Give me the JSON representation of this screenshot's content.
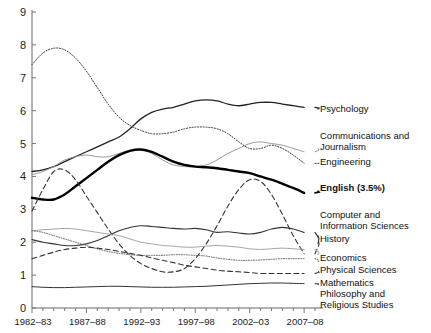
{
  "chart_data": {
    "type": "line",
    "title": "",
    "xlabel": "",
    "ylabel": "",
    "xlim": [
      1982,
      2008
    ],
    "ylim": [
      0,
      9
    ],
    "grid": false,
    "legend_position": "right-inline",
    "x_tick_labels": [
      "1982–83",
      "1987–88",
      "1992–93",
      "1997–98",
      "2002–03",
      "2007–08"
    ],
    "x_tick_values": [
      1982,
      1987,
      1992,
      1997,
      2002,
      2007
    ],
    "y_tick_labels": [
      "0",
      "1",
      "2",
      "3",
      "4",
      "5",
      "6",
      "7",
      "8",
      "9"
    ],
    "y_tick_values": [
      0,
      1,
      2,
      3,
      4,
      5,
      6,
      7,
      8,
      9
    ],
    "x": [
      1982,
      1983,
      1984,
      1985,
      1986,
      1987,
      1988,
      1989,
      1990,
      1991,
      1992,
      1993,
      1994,
      1995,
      1996,
      1997,
      1998,
      1999,
      2000,
      2001,
      2002,
      2003,
      2004,
      2005,
      2006,
      2007
    ],
    "series": [
      {
        "name": "Psychology",
        "label": "Psychology",
        "style": "solid",
        "width": 1.3,
        "color": "#222222",
        "label_y_value": 6.05,
        "values": [
          4.15,
          4.2,
          4.3,
          4.45,
          4.6,
          4.75,
          4.9,
          5.05,
          5.2,
          5.45,
          5.75,
          5.95,
          6.05,
          6.1,
          6.2,
          6.3,
          6.33,
          6.3,
          6.2,
          6.15,
          6.2,
          6.25,
          6.25,
          6.2,
          6.15,
          6.1
        ]
      },
      {
        "name": "Communications and Journalism",
        "label": "Communications and Journalism",
        "style": "solid",
        "width": 1.0,
        "color": "#9a9a9a",
        "label_y_value": 4.85,
        "values": [
          4.05,
          4.15,
          4.3,
          4.5,
          4.6,
          4.65,
          4.6,
          4.6,
          4.7,
          4.8,
          4.82,
          4.7,
          4.5,
          4.35,
          4.3,
          4.3,
          4.35,
          4.5,
          4.7,
          4.85,
          5.0,
          5.05,
          5.0,
          4.95,
          4.85,
          4.75
        ]
      },
      {
        "name": "Engineering",
        "label": "Engineering",
        "style": "dotted",
        "width": 1.0,
        "color": "#333333",
        "label_y_value": 4.4,
        "values": [
          7.4,
          7.75,
          7.9,
          7.85,
          7.6,
          7.2,
          6.7,
          6.2,
          5.8,
          5.55,
          5.4,
          5.3,
          5.3,
          5.35,
          5.45,
          5.5,
          5.5,
          5.45,
          5.3,
          5.05,
          4.85,
          4.85,
          4.95,
          4.85,
          4.65,
          4.4
        ]
      },
      {
        "name": "English",
        "label": "English (3.5%)",
        "style": "solid",
        "width": 2.4,
        "color": "#000000",
        "label_y_value": 3.55,
        "values": [
          3.35,
          3.3,
          3.3,
          3.45,
          3.7,
          3.95,
          4.2,
          4.45,
          4.65,
          4.78,
          4.82,
          4.75,
          4.6,
          4.45,
          4.35,
          4.3,
          4.28,
          4.25,
          4.2,
          4.15,
          4.1,
          4.0,
          3.9,
          3.78,
          3.65,
          3.5
        ]
      },
      {
        "name": "Computer and Information Sciences",
        "label": "Computer and Information Sciences",
        "style": "dashed",
        "width": 1.1,
        "color": "#333333",
        "label_y_value": 2.2,
        "values": [
          2.95,
          3.6,
          4.15,
          4.2,
          3.9,
          3.4,
          2.9,
          2.4,
          1.95,
          1.6,
          1.35,
          1.2,
          1.1,
          1.1,
          1.2,
          1.5,
          1.95,
          2.5,
          3.1,
          3.6,
          3.9,
          3.85,
          3.45,
          2.85,
          2.2,
          1.65
        ]
      },
      {
        "name": "History",
        "label": "History",
        "style": "solid",
        "width": 1.1,
        "color": "#333333",
        "label_y_value": 1.95,
        "values": [
          2.08,
          2.0,
          1.95,
          1.9,
          1.9,
          1.95,
          2.05,
          2.2,
          2.35,
          2.45,
          2.5,
          2.48,
          2.45,
          2.42,
          2.4,
          2.42,
          2.38,
          2.3,
          2.32,
          2.28,
          2.25,
          2.3,
          2.4,
          2.45,
          2.4,
          2.3
        ]
      },
      {
        "name": "Economics",
        "label": "Economics",
        "style": "solid",
        "width": 0.9,
        "color": "#9a9a9a",
        "label_y_value": 1.62,
        "values": [
          2.35,
          2.38,
          2.4,
          2.42,
          2.4,
          2.35,
          2.3,
          2.25,
          2.2,
          2.1,
          2.0,
          1.95,
          1.9,
          1.88,
          1.85,
          1.85,
          1.88,
          1.9,
          1.88,
          1.85,
          1.8,
          1.78,
          1.8,
          1.82,
          1.8,
          1.78
        ]
      },
      {
        "name": "Physical Sciences",
        "label": "Physical Sciences",
        "style": "dotted",
        "width": 0.9,
        "color": "#555555",
        "label_y_value": 1.4,
        "values": [
          2.35,
          2.3,
          2.2,
          2.1,
          2.0,
          1.9,
          1.8,
          1.72,
          1.66,
          1.62,
          1.6,
          1.6,
          1.6,
          1.62,
          1.62,
          1.6,
          1.58,
          1.52,
          1.48,
          1.45,
          1.45,
          1.46,
          1.48,
          1.5,
          1.5,
          1.5
        ]
      },
      {
        "name": "Mathematics",
        "label": "Mathematics",
        "style": "dashed",
        "width": 1.1,
        "color": "#333333",
        "label_y_value": 1.12,
        "values": [
          1.5,
          1.6,
          1.7,
          1.78,
          1.82,
          1.85,
          1.82,
          1.78,
          1.72,
          1.66,
          1.6,
          1.52,
          1.45,
          1.38,
          1.3,
          1.25,
          1.2,
          1.15,
          1.12,
          1.1,
          1.08,
          1.05,
          1.05,
          1.05,
          1.05,
          1.05
        ]
      },
      {
        "name": "Philosophy and Religious Studies",
        "label": "Philosophy and Religious Studies",
        "style": "solid",
        "width": 1.0,
        "color": "#333333",
        "label_y_value": 0.72,
        "values": [
          0.65,
          0.63,
          0.62,
          0.62,
          0.63,
          0.64,
          0.65,
          0.66,
          0.66,
          0.65,
          0.64,
          0.63,
          0.63,
          0.63,
          0.64,
          0.65,
          0.66,
          0.68,
          0.7,
          0.72,
          0.74,
          0.75,
          0.76,
          0.76,
          0.75,
          0.74
        ]
      }
    ]
  },
  "legend": {
    "psychology": "Psychology",
    "communications_line1": "Communications and",
    "communications_line2": "Journalism",
    "engineering": "Engineering",
    "english": "English (3.5%)",
    "computer_line1": "Computer and",
    "computer_line2": "Information Sciences",
    "history": "History",
    "economics": "Economics",
    "physical_sciences": "Physical Sciences",
    "mathematics": "Mathematics",
    "philosophy_line1": "Philosophy and",
    "philosophy_line2": "Religious Studies"
  }
}
